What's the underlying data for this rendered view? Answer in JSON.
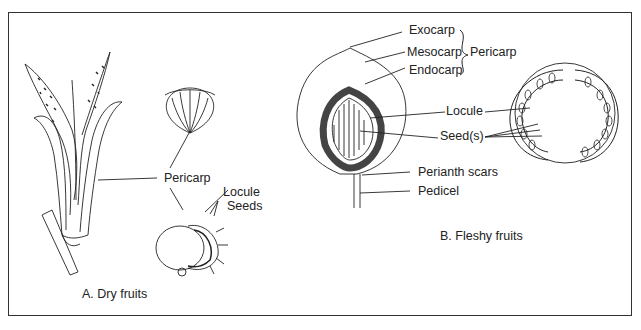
{
  "panels": {
    "dry": {
      "caption": "A. Dry fruits",
      "labels": {
        "pericarp": "Pericarp",
        "locule": "Locule",
        "seeds": "Seeds"
      }
    },
    "fleshy": {
      "caption": "B. Fleshy fruits",
      "labels": {
        "exocarp": "Exocarp",
        "mesocarp": "Mesocarp",
        "endocarp": "Endocarp",
        "pericarp": "Pericarp",
        "locule": "Locule",
        "seeds": "Seed(s)",
        "perianth_scars": "Perianth scars",
        "pedicel": "Pedicel"
      }
    }
  },
  "colors": {
    "line": "#222222",
    "border": "#333333",
    "background": "#ffffff"
  }
}
